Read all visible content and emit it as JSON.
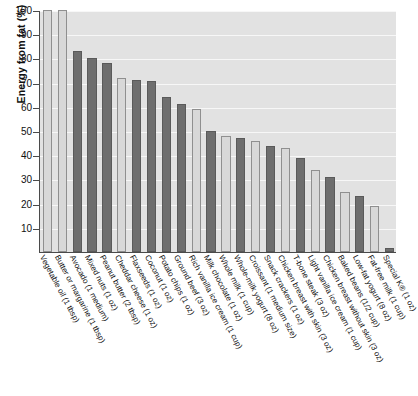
{
  "chart_data": {
    "type": "bar",
    "title": "",
    "xlabel": "",
    "ylabel": "Energy from fat (%)",
    "ylim": [
      0,
      100
    ],
    "ytick_step": 10,
    "yticks": [
      10,
      20,
      30,
      40,
      50,
      60,
      70,
      80,
      90,
      100
    ],
    "ytick_labels": [
      "10",
      "20",
      "30",
      "40",
      "50",
      "60",
      "70",
      "80",
      "90",
      "100"
    ],
    "grid": true,
    "grid_color": "#f7f7f7",
    "legend": "none",
    "plot_background": "#e2e2e2",
    "axis_color": "#4a4a4a",
    "bar_colors": [
      "#d8d8d8",
      "#6e6e6e"
    ],
    "categories": [
      "Vegetable oil (1 tbsp)",
      "Butter or margarine (1 tbsp)",
      "Avocado (1 medium)",
      "Mixed nuts (1 oz)",
      "Peanut butter (2 tbsp)",
      "Cheddar cheese (1 oz)",
      "Flaxseeds (1 oz)",
      "Coconut (1 oz)",
      "Potato chips (1 oz)",
      "Ground beef (3 oz)",
      "Rich vanilla ice cream (1 cup)",
      "Milk chocolate (1 oz)",
      "Whole milk (1 cup)",
      "Whole-milk yogurt (8 oz)",
      "Croissant (1 medium size)",
      "Snack crackers (1 oz)",
      "Chicken breast with skin (3 oz)",
      "T-bone steak (3 oz)",
      "Light vanilla ice cream (1 cup)",
      "Chicken breast without skin (3 oz)",
      "Baked beans (1/2 cup)",
      "Low-fat yogurt (8 oz)",
      "Fat-free milk (1 cup)",
      "Special K® (1 oz)"
    ],
    "values": [
      100,
      100,
      83,
      80,
      78,
      72,
      71,
      70.5,
      64,
      61,
      59,
      50,
      48,
      47,
      46,
      44,
      43,
      39,
      34,
      31,
      25,
      23,
      19,
      1.5
    ],
    "shades": [
      0,
      0,
      1,
      1,
      1,
      0,
      1,
      1,
      1,
      1,
      0,
      1,
      0,
      1,
      0,
      1,
      0,
      1,
      0,
      1,
      0,
      1,
      0,
      1
    ]
  }
}
